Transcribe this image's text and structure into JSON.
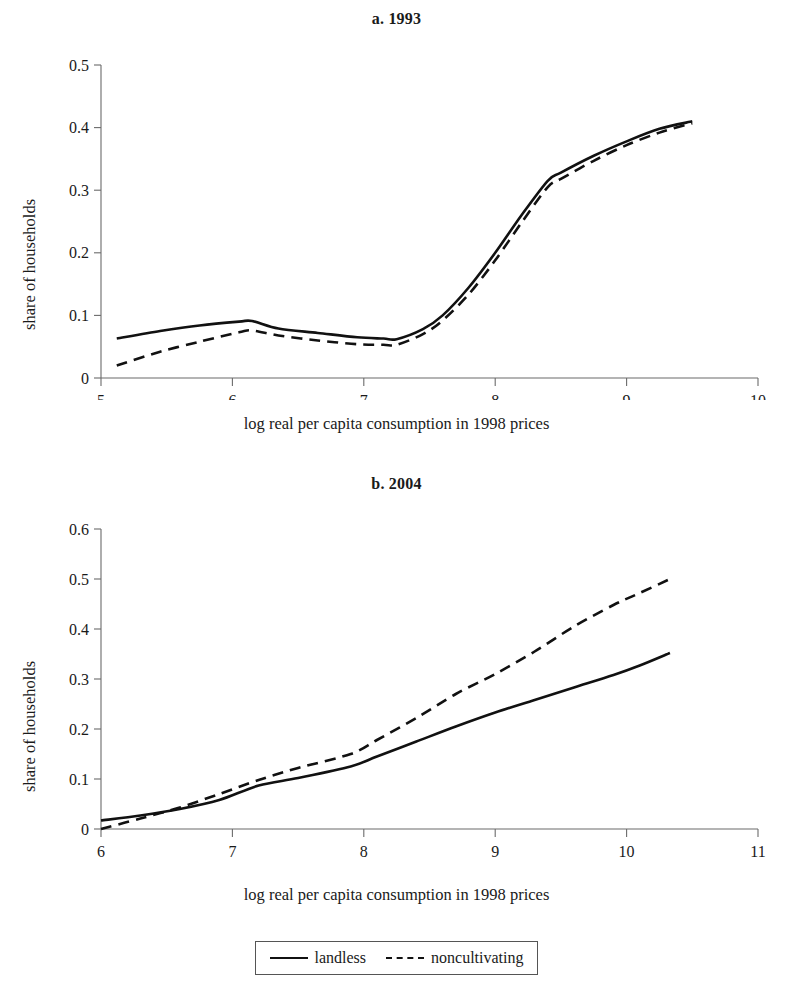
{
  "figure": {
    "axis_title_x": "log real per capita consumption in 1998 prices",
    "axis_title_y": "share of households"
  },
  "legend": {
    "entries": [
      {
        "label": "landless",
        "style": "solid",
        "swatch_icon": "solid-line-icon"
      },
      {
        "label": "noncultivating",
        "style": "dashed",
        "swatch_icon": "dashed-line-icon"
      }
    ]
  },
  "chart_data": [
    {
      "type": "line",
      "title": "a. 1993",
      "xlabel": "log real per capita consumption in 1998 prices",
      "ylabel": "share of households",
      "xlim": [
        5,
        10
      ],
      "ylim": [
        0,
        0.5
      ],
      "xticks": [
        5,
        6,
        7,
        8,
        9,
        10
      ],
      "xtick_labels": [
        "5",
        "6",
        "7",
        "8",
        "9",
        "10"
      ],
      "yticks": [
        0,
        0.1,
        0.2,
        0.3,
        0.4,
        0.5
      ],
      "ytick_labels": [
        "0",
        "0.1",
        "0.2",
        "0.3",
        "0.4",
        "0.5"
      ],
      "grid": false,
      "legend_position": "below-figure",
      "series": [
        {
          "name": "landless",
          "style": "solid",
          "x": [
            5.12,
            5.45,
            5.75,
            6.05,
            6.15,
            6.35,
            6.65,
            6.95,
            7.15,
            7.25,
            7.45,
            7.6,
            7.8,
            8.0,
            8.2,
            8.4,
            8.5,
            8.75,
            9.0,
            9.25,
            9.5
          ],
          "y": [
            0.063,
            0.075,
            0.084,
            0.09,
            0.091,
            0.079,
            0.072,
            0.065,
            0.063,
            0.062,
            0.078,
            0.1,
            0.145,
            0.2,
            0.26,
            0.315,
            0.328,
            0.355,
            0.378,
            0.398,
            0.41
          ]
        },
        {
          "name": "noncultivating",
          "style": "dashed",
          "x": [
            5.12,
            5.45,
            5.75,
            6.05,
            6.15,
            6.35,
            6.65,
            6.95,
            7.15,
            7.25,
            7.45,
            7.6,
            7.8,
            8.0,
            8.2,
            8.4,
            8.5,
            8.75,
            9.0,
            9.25,
            9.5
          ],
          "y": [
            0.02,
            0.042,
            0.058,
            0.073,
            0.076,
            0.068,
            0.06,
            0.054,
            0.053,
            0.053,
            0.07,
            0.092,
            0.134,
            0.188,
            0.248,
            0.305,
            0.318,
            0.347,
            0.372,
            0.392,
            0.407
          ]
        }
      ]
    },
    {
      "type": "line",
      "title": "b. 2004",
      "xlabel": "log real per capita consumption in 1998 prices",
      "ylabel": "share of households",
      "xlim": [
        6,
        11
      ],
      "ylim": [
        0,
        0.6
      ],
      "xticks": [
        6,
        7,
        8,
        9,
        10,
        11
      ],
      "xtick_labels": [
        "6",
        "7",
        "8",
        "9",
        "10",
        "11"
      ],
      "yticks": [
        0,
        0.1,
        0.2,
        0.3,
        0.4,
        0.5,
        0.6
      ],
      "ytick_labels": [
        "0",
        "0.1",
        "0.2",
        "0.3",
        "0.4",
        "0.5",
        "0.6"
      ],
      "grid": false,
      "legend_position": "below-figure",
      "series": [
        {
          "name": "landless",
          "style": "solid",
          "x": [
            6.0,
            6.3,
            6.6,
            6.9,
            7.2,
            7.5,
            7.9,
            8.1,
            8.4,
            8.7,
            9.0,
            9.3,
            9.6,
            9.9,
            10.1,
            10.33
          ],
          "y": [
            0.017,
            0.027,
            0.04,
            0.058,
            0.087,
            0.102,
            0.125,
            0.145,
            0.175,
            0.205,
            0.233,
            0.258,
            0.283,
            0.308,
            0.327,
            0.352
          ]
        },
        {
          "name": "noncultivating",
          "style": "dashed",
          "x": [
            6.0,
            6.3,
            6.6,
            6.9,
            7.2,
            7.5,
            7.9,
            8.1,
            8.4,
            8.7,
            9.0,
            9.3,
            9.6,
            9.9,
            10.1,
            10.33
          ],
          "y": [
            0.0,
            0.021,
            0.043,
            0.07,
            0.098,
            0.122,
            0.15,
            0.178,
            0.222,
            0.27,
            0.31,
            0.355,
            0.405,
            0.448,
            0.472,
            0.5
          ]
        }
      ]
    }
  ]
}
